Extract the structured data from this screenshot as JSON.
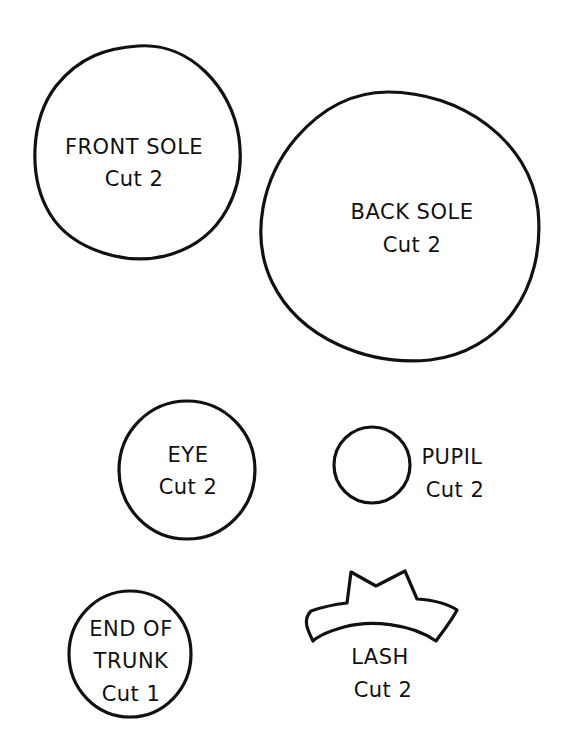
{
  "page": {
    "background": "#ffffff",
    "ink_color": "#111111"
  },
  "pieces": [
    {
      "id": "front-sole",
      "shape": "irregular-circle",
      "lines": [
        "FRONT SOLE",
        "Cut 2"
      ]
    },
    {
      "id": "back-sole",
      "shape": "irregular-oval",
      "lines": [
        "BACK SOLE",
        "Cut 2"
      ]
    },
    {
      "id": "eye",
      "shape": "circle",
      "lines": [
        "EYE",
        "Cut 2"
      ]
    },
    {
      "id": "pupil",
      "shape": "small-circle",
      "lines": [
        "PUPIL",
        "Cut 2"
      ]
    },
    {
      "id": "end-of-trunk",
      "shape": "circle",
      "lines": [
        "END OF",
        "TRUNK",
        "Cut 1"
      ]
    },
    {
      "id": "lash",
      "shape": "crown",
      "lines": [
        "LASH",
        "Cut 2"
      ]
    }
  ]
}
